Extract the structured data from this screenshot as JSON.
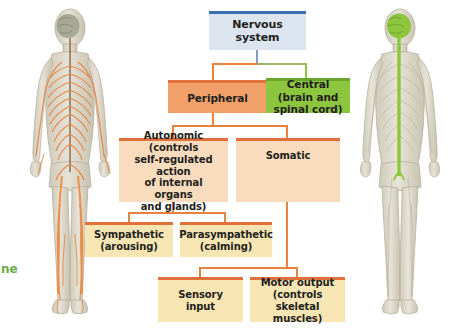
{
  "diagram": {
    "root": {
      "label": "Nervous\nsystem",
      "line1": "Nervous",
      "line2": "system",
      "color": "#dce4ef",
      "accent": "#3a6fb0"
    },
    "level1": [
      {
        "id": "peripheral",
        "line1": "Peripheral",
        "line2": "",
        "color": "#f0a068",
        "accent": "#e0713a"
      },
      {
        "id": "central",
        "line1": "Central (brain and",
        "line2": "spinal cord)",
        "color": "#8cc63e",
        "accent": "#69a42c"
      }
    ],
    "level2": [
      {
        "id": "autonomic",
        "line1": "Autonomic (controls",
        "line2": "self-regulated action",
        "line3": "of internal organs",
        "line4": "and glands)",
        "color": "#f8dcbd",
        "accent": "#e0713a"
      },
      {
        "id": "somatic",
        "line1": "Somatic",
        "line2": "",
        "color": "#f8dcbd",
        "accent": "#e0713a"
      }
    ],
    "level3": [
      {
        "id": "sympathetic",
        "line1": "Sympathetic",
        "line2": "(arousing)",
        "color": "#f7e6b4",
        "accent": "#e0713a"
      },
      {
        "id": "parasympathetic",
        "line1": "Parasympathetic",
        "line2": "(calming)",
        "color": "#f7e6b4",
        "accent": "#e0713a"
      }
    ],
    "level4": [
      {
        "id": "sensory-input",
        "line1": "Sensory",
        "line2": "input",
        "color": "#f7e6b4",
        "accent": "#e0713a"
      },
      {
        "id": "motor-output",
        "line1": "Motor output",
        "line2": "(controls skeletal",
        "line3": "muscles)",
        "color": "#f7e6b4",
        "accent": "#e0713a"
      }
    ],
    "figures": {
      "left": {
        "name": "peripheral-nervous-system-figure",
        "nerve_color": "#e8833f",
        "brain_color": "#9a9d84",
        "body_color": "#d9d4c4"
      },
      "right": {
        "name": "central-nervous-system-figure",
        "nerve_color": "#8cc63e",
        "brain_color": "#8cc63e",
        "body_color": "#d9d4c4"
      }
    },
    "cropped_caption": "ne"
  }
}
